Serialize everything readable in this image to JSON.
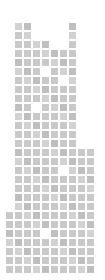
{
  "figure": {
    "width_px": 105,
    "height_px": 280,
    "background_color": "#ffffff",
    "tile_color": "#c9c9c9",
    "tile_size_px": 7,
    "tile_pitch_px": 9,
    "origin_x_px": 6,
    "origin_y_px": 14,
    "columns": 10,
    "rows": 29
  },
  "chart_data": {
    "type": "heatmap",
    "subtitle": "",
    "xlabel": "",
    "ylabel": "",
    "grid": false,
    "legend_position": "none",
    "colorscale": [
      "#ffffff",
      "#c9c9c9"
    ],
    "x": [
      0,
      1,
      2,
      3,
      4,
      5,
      6,
      7,
      8,
      9
    ],
    "y": [
      0,
      1,
      2,
      3,
      4,
      5,
      6,
      7,
      8,
      9,
      10,
      11,
      12,
      13,
      14,
      15,
      16,
      17,
      18,
      19,
      20,
      21,
      22,
      23,
      24,
      25,
      26,
      27,
      28
    ],
    "categories": [
      "c0",
      "c1",
      "c2",
      "c3",
      "c4",
      "c5",
      "c6",
      "c7",
      "c8",
      "c9"
    ],
    "values": [
      18,
      28,
      28,
      27,
      26,
      25,
      25,
      29,
      15,
      14
    ],
    "series": [
      {
        "name": "column-heights",
        "values": [
          18,
          28,
          28,
          27,
          26,
          25,
          25,
          29,
          15,
          14
        ]
      }
    ],
    "cells": [
      [
        0,
        0,
        0,
        0,
        0,
        0,
        0,
        0,
        0,
        0
      ],
      [
        0,
        1,
        1,
        0,
        0,
        0,
        0,
        1,
        0,
        0
      ],
      [
        0,
        1,
        1,
        0,
        0,
        0,
        0,
        1,
        0,
        0
      ],
      [
        0,
        1,
        1,
        1,
        1,
        0,
        0,
        1,
        0,
        0
      ],
      [
        0,
        1,
        1,
        1,
        1,
        1,
        1,
        1,
        0,
        0
      ],
      [
        0,
        1,
        1,
        1,
        1,
        1,
        1,
        1,
        0,
        0
      ],
      [
        0,
        1,
        1,
        1,
        0,
        1,
        1,
        1,
        0,
        0
      ],
      [
        0,
        1,
        1,
        1,
        1,
        1,
        0,
        1,
        0,
        0
      ],
      [
        0,
        1,
        1,
        1,
        1,
        1,
        1,
        1,
        0,
        0
      ],
      [
        0,
        1,
        1,
        1,
        1,
        1,
        1,
        1,
        0,
        0
      ],
      [
        0,
        1,
        1,
        0,
        1,
        1,
        1,
        1,
        0,
        0
      ],
      [
        0,
        1,
        1,
        1,
        1,
        1,
        1,
        1,
        0,
        0
      ],
      [
        0,
        1,
        1,
        1,
        1,
        1,
        1,
        1,
        0,
        0
      ],
      [
        0,
        1,
        1,
        1,
        1,
        1,
        1,
        1,
        0,
        0
      ],
      [
        0,
        1,
        1,
        1,
        1,
        1,
        1,
        1,
        0,
        0
      ],
      [
        0,
        1,
        1,
        1,
        1,
        1,
        1,
        1,
        1,
        1
      ],
      [
        0,
        1,
        1,
        1,
        1,
        1,
        1,
        1,
        1,
        1
      ],
      [
        0,
        1,
        1,
        1,
        1,
        1,
        0,
        1,
        1,
        1
      ],
      [
        0,
        1,
        1,
        1,
        1,
        1,
        1,
        1,
        1,
        1
      ],
      [
        0,
        1,
        1,
        1,
        1,
        1,
        1,
        1,
        1,
        1
      ],
      [
        0,
        1,
        1,
        1,
        1,
        1,
        1,
        1,
        1,
        1
      ],
      [
        0,
        1,
        1,
        1,
        1,
        1,
        1,
        1,
        1,
        1
      ],
      [
        1,
        1,
        1,
        1,
        1,
        1,
        1,
        1,
        1,
        1
      ],
      [
        1,
        1,
        1,
        1,
        1,
        1,
        1,
        1,
        1,
        1
      ],
      [
        1,
        1,
        1,
        1,
        0,
        1,
        1,
        1,
        1,
        1
      ],
      [
        1,
        1,
        1,
        1,
        1,
        1,
        1,
        1,
        1,
        1
      ],
      [
        1,
        1,
        1,
        1,
        1,
        1,
        1,
        1,
        1,
        1
      ],
      [
        1,
        1,
        1,
        1,
        1,
        1,
        1,
        1,
        1,
        1
      ],
      [
        1,
        1,
        1,
        1,
        1,
        1,
        1,
        1,
        1,
        1
      ]
    ],
    "ylim": [
      0,
      29
    ],
    "xlim": [
      0,
      10
    ]
  }
}
